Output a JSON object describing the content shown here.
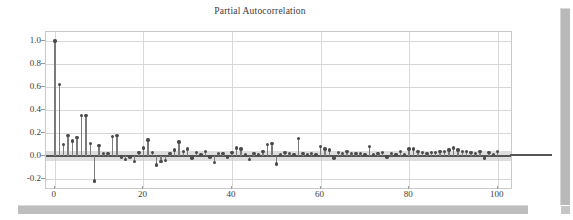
{
  "window": {
    "vertical_scrollbar": "vertical-scrollbar",
    "horizontal_scrollbar": "horizontal-scrollbar"
  },
  "chart_data": {
    "type": "bar",
    "title": "Partial Autocorrelation",
    "xlabel": "",
    "ylabel": "",
    "xlim": [
      -2,
      103
    ],
    "ylim": [
      -0.28,
      1.08
    ],
    "grid": true,
    "legend": "none",
    "ytick_labels": [
      "1.0",
      "0.8",
      "0.6",
      "0.4",
      "0.2",
      "0.0",
      "-0.2"
    ],
    "ytick_values": [
      1.0,
      0.8,
      0.6,
      0.4,
      0.2,
      0.0,
      -0.2
    ],
    "xtick_labels": [
      "0",
      "20",
      "40",
      "60",
      "80",
      "100"
    ],
    "xtick_values": [
      0,
      20,
      40,
      60,
      80,
      100
    ],
    "confidence_band": {
      "upper": 0.045,
      "lower": -0.045,
      "color": "#c9c9c9"
    },
    "series_color": "#7b7b7b",
    "marker_color": "#4a4a4a",
    "x": [
      0,
      1,
      2,
      3,
      4,
      5,
      6,
      7,
      8,
      9,
      10,
      11,
      12,
      13,
      14,
      15,
      16,
      17,
      18,
      19,
      20,
      21,
      22,
      23,
      24,
      25,
      26,
      27,
      28,
      29,
      30,
      31,
      32,
      33,
      34,
      35,
      36,
      37,
      38,
      39,
      40,
      41,
      42,
      43,
      44,
      45,
      46,
      47,
      48,
      49,
      50,
      51,
      52,
      53,
      54,
      55,
      56,
      57,
      58,
      59,
      60,
      61,
      62,
      63,
      64,
      65,
      66,
      67,
      68,
      69,
      70,
      71,
      72,
      73,
      74,
      75,
      76,
      77,
      78,
      79,
      80,
      81,
      82,
      83,
      84,
      85,
      86,
      87,
      88,
      89,
      90,
      91,
      92,
      93,
      94,
      95,
      96,
      97,
      98,
      99,
      100
    ],
    "values": [
      1.0,
      0.62,
      0.1,
      0.18,
      0.13,
      0.16,
      0.35,
      0.35,
      0.11,
      -0.22,
      0.09,
      0.02,
      0.02,
      0.17,
      0.18,
      -0.01,
      -0.03,
      -0.01,
      -0.05,
      0.03,
      0.07,
      0.14,
      0.03,
      -0.08,
      -0.05,
      -0.04,
      0.02,
      0.05,
      0.12,
      0.04,
      0.06,
      -0.02,
      0.03,
      0.01,
      0.04,
      -0.01,
      -0.06,
      0.02,
      0.02,
      -0.01,
      0.03,
      0.07,
      0.06,
      0.01,
      -0.03,
      0.02,
      0.01,
      0.04,
      0.1,
      0.11,
      -0.07,
      0.01,
      0.03,
      0.02,
      0.01,
      0.15,
      0.02,
      0.01,
      0.02,
      0.01,
      0.08,
      0.06,
      0.05,
      -0.02,
      0.03,
      0.02,
      0.04,
      0.02,
      0.02,
      0.02,
      0.01,
      0.08,
      0.01,
      0.02,
      0.03,
      -0.01,
      0.02,
      0.01,
      0.04,
      0.01,
      0.06,
      0.06,
      0.04,
      0.03,
      0.02,
      0.03,
      0.03,
      0.04,
      0.04,
      0.05,
      0.07,
      0.05,
      0.04,
      0.04,
      0.03,
      0.02,
      0.04,
      -0.02,
      0.03,
      0.01,
      0.04
    ]
  }
}
